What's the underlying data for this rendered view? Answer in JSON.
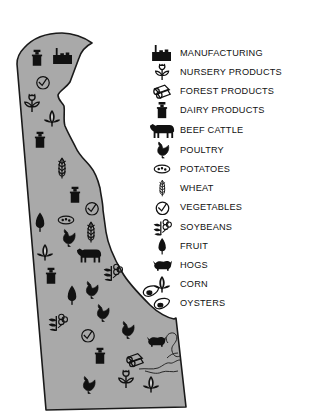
{
  "map": {
    "title": "",
    "region": "Delaware",
    "fill_color": "#a9a9a9",
    "outline_color": "#1a1a1a"
  },
  "legend": {
    "items": [
      {
        "key": "manufacturing",
        "label": "MANUFACTURING",
        "icon": "factory-icon"
      },
      {
        "key": "nursery",
        "label": "NURSERY PRODUCTS",
        "icon": "plant-flower-icon"
      },
      {
        "key": "forest",
        "label": "FOREST PRODUCTS",
        "icon": "logs-icon"
      },
      {
        "key": "dairy",
        "label": "DAIRY PRODUCTS",
        "icon": "milk-can-icon"
      },
      {
        "key": "beef",
        "label": "BEEF CATTLE",
        "icon": "cow-icon"
      },
      {
        "key": "poultry",
        "label": "POULTRY",
        "icon": "chicken-icon"
      },
      {
        "key": "potatoes",
        "label": "POTATOES",
        "icon": "potato-icon"
      },
      {
        "key": "wheat",
        "label": "WHEAT",
        "icon": "wheat-icon"
      },
      {
        "key": "vegetables",
        "label": "VEGETABLES",
        "icon": "tomato-icon"
      },
      {
        "key": "soybeans",
        "label": "SOYBEANS",
        "icon": "soybean-plant-icon"
      },
      {
        "key": "fruit",
        "label": "FRUIT",
        "icon": "tree-icon"
      },
      {
        "key": "hogs",
        "label": "HOGS",
        "icon": "hog-icon"
      },
      {
        "key": "corn",
        "label": "CORN",
        "icon": "corn-icon"
      },
      {
        "key": "oysters",
        "label": "OYSTERS",
        "icon": "oyster-icon"
      }
    ]
  },
  "map_symbols": [
    {
      "type": "dairy",
      "x": 37,
      "y": 58
    },
    {
      "type": "manufacturing",
      "x": 63,
      "y": 56
    },
    {
      "type": "vegetables",
      "x": 43,
      "y": 82
    },
    {
      "type": "nursery",
      "x": 32,
      "y": 103
    },
    {
      "type": "corn",
      "x": 52,
      "y": 118
    },
    {
      "type": "dairy",
      "x": 40,
      "y": 140
    },
    {
      "type": "wheat",
      "x": 62,
      "y": 168
    },
    {
      "type": "dairy",
      "x": 75,
      "y": 195
    },
    {
      "type": "vegetables",
      "x": 92,
      "y": 208
    },
    {
      "type": "fruit",
      "x": 40,
      "y": 222
    },
    {
      "type": "potatoes",
      "x": 66,
      "y": 220
    },
    {
      "type": "wheat",
      "x": 91,
      "y": 232
    },
    {
      "type": "poultry",
      "x": 68,
      "y": 238
    },
    {
      "type": "corn",
      "x": 45,
      "y": 252
    },
    {
      "type": "beef",
      "x": 89,
      "y": 255
    },
    {
      "type": "soybeans",
      "x": 113,
      "y": 272
    },
    {
      "type": "dairy",
      "x": 51,
      "y": 276
    },
    {
      "type": "poultry",
      "x": 91,
      "y": 290
    },
    {
      "type": "fruit",
      "x": 72,
      "y": 295
    },
    {
      "type": "poultry",
      "x": 102,
      "y": 313
    },
    {
      "type": "soybeans",
      "x": 58,
      "y": 322
    },
    {
      "type": "poultry",
      "x": 127,
      "y": 330
    },
    {
      "type": "vegetables",
      "x": 88,
      "y": 335
    },
    {
      "type": "hogs",
      "x": 156,
      "y": 341
    },
    {
      "type": "dairy",
      "x": 100,
      "y": 356
    },
    {
      "type": "forest",
      "x": 135,
      "y": 360
    },
    {
      "type": "nursery",
      "x": 126,
      "y": 379
    },
    {
      "type": "corn",
      "x": 151,
      "y": 384
    },
    {
      "type": "poultry",
      "x": 88,
      "y": 385
    },
    {
      "type": "oysters",
      "x": 151,
      "y": 291
    }
  ]
}
